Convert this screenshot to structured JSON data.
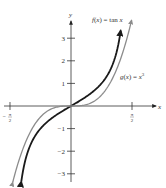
{
  "chart_data": {
    "type": "line",
    "title": "",
    "xlabel": "x",
    "ylabel": "y",
    "xlim": [
      -1.8,
      2.1
    ],
    "ylim": [
      -3.4,
      3.9
    ],
    "grid": false,
    "x_ticks": [
      {
        "value": -1.5708,
        "label_num": "π",
        "label_den": "2",
        "sign": "−"
      },
      {
        "value": 1.5708,
        "label_num": "π",
        "label_den": "2",
        "sign": ""
      }
    ],
    "y_ticks": [
      {
        "value": 3,
        "label": "3"
      },
      {
        "value": 2,
        "label": "2"
      },
      {
        "value": 1,
        "label": "1"
      },
      {
        "value": -1,
        "label": "−1"
      },
      {
        "value": -2,
        "label": "−2"
      },
      {
        "value": -3,
        "label": "−3"
      }
    ],
    "series": [
      {
        "name": "f(x) = tan x",
        "label_parts": {
          "fname": "f",
          "arg": "(x)",
          "eq": " = tan ",
          "var": "x"
        },
        "function": "tan",
        "x_range": [
          -1.28,
          1.28
        ],
        "color": "#1a1a1a",
        "label_anchor": "top"
      },
      {
        "name": "g(x) = x^3",
        "label_parts": {
          "fname": "g",
          "arg": "(x)",
          "eq": " = ",
          "var": "x",
          "exp": "3"
        },
        "function": "cube",
        "x_range": [
          -1.5,
          1.56
        ],
        "color": "#8c8c8c",
        "label_anchor": "right"
      }
    ]
  }
}
